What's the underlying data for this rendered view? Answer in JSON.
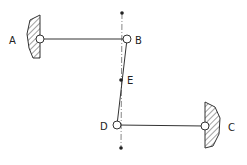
{
  "diagram": {
    "type": "mechanism-linkage",
    "colors": {
      "stroke": "#333333",
      "hatch": "#444444",
      "background": "#ffffff"
    },
    "labels": {
      "A": "A",
      "B": "B",
      "C": "C",
      "D": "D",
      "E": "E"
    },
    "points": {
      "A": {
        "x": 40,
        "y": 39,
        "kind": "fixed-pivot"
      },
      "B": {
        "x": 127,
        "y": 39,
        "kind": "pin-joint"
      },
      "E": {
        "x": 121,
        "y": 80,
        "kind": "point"
      },
      "D": {
        "x": 117,
        "y": 125,
        "kind": "pin-joint"
      },
      "C": {
        "x": 205,
        "y": 126,
        "kind": "fixed-pivot"
      },
      "top_dot": {
        "x": 122,
        "y": 13
      },
      "bottom_dot": {
        "x": 121,
        "y": 148
      }
    },
    "links": [
      {
        "from": "A",
        "to": "B",
        "style": "solid"
      },
      {
        "from": "B",
        "to": "D",
        "style": "solid"
      },
      {
        "from": "D",
        "to": "C",
        "style": "solid"
      },
      {
        "from": "top_dot",
        "to": "bottom_dot",
        "style": "dash-dot"
      }
    ]
  }
}
